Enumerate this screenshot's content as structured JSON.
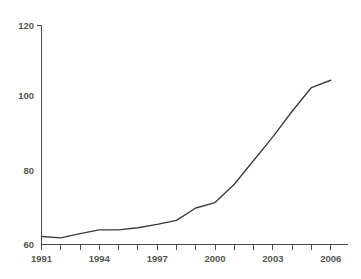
{
  "chart_data": {
    "type": "line",
    "title": "",
    "subtitle": "",
    "xlabel": "",
    "ylabel": "",
    "x": [
      1991,
      1992,
      1993,
      1994,
      1995,
      1996,
      1997,
      1998,
      1999,
      2000,
      2001,
      2002,
      2003,
      2004,
      2005,
      2006
    ],
    "series": [
      {
        "name": "",
        "values": [
          62.2,
          61.8,
          63.0,
          64.0,
          64.0,
          64.6,
          65.5,
          66.6,
          70.0,
          71.5,
          76.5,
          83.0,
          89.5,
          96.5,
          103.0,
          105.0
        ]
      }
    ],
    "xlim": [
      1991,
      2006
    ],
    "ylim": [
      60,
      120
    ],
    "xticks": [
      1991,
      1992,
      1993,
      1994,
      1995,
      1996,
      1997,
      1998,
      1999,
      2000,
      2001,
      2002,
      2003,
      2004,
      2005,
      2006
    ],
    "xticklabels": [
      "1991",
      "",
      "",
      "1994",
      "",
      "",
      "1997",
      "",
      "",
      "2000",
      "",
      "",
      "2003",
      "",
      "",
      "2006"
    ],
    "yticks": [
      60,
      80,
      100,
      120
    ],
    "yticklabels": [
      "60",
      "80",
      "100",
      "120"
    ],
    "grid": false,
    "legend": false,
    "legend_position": "none",
    "line_color": "#3b3b3b",
    "axis_color": "#4a4a4a",
    "label_color": "#555555",
    "background_color": "#ffffff",
    "annotations": []
  }
}
